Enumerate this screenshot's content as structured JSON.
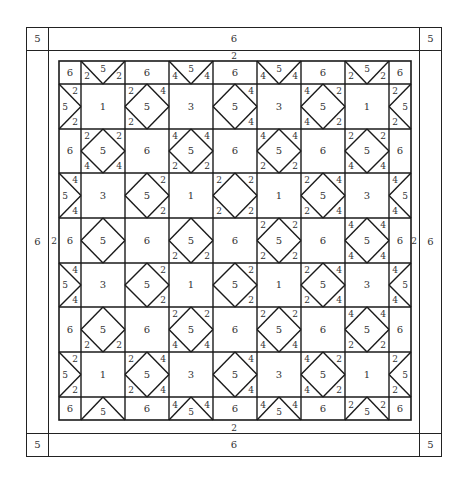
{
  "diagram": {
    "type": "quilt-layout",
    "outer_border": {
      "top_label": "6",
      "bottom_label": "6",
      "left_label": "6",
      "right_label": "6",
      "corner_label": "5"
    },
    "inner_border": {
      "top_label": "2",
      "bottom_label": "2",
      "left_label": "2",
      "right_label": "2"
    },
    "grid": {
      "col_widths": [
        22,
        44,
        44,
        44,
        44,
        44,
        44,
        44,
        22
      ],
      "row_heights": [
        23,
        45,
        44,
        45,
        45,
        44,
        45,
        45,
        23
      ],
      "rows": [
        [
          {
            "t": "plain",
            "label": "6"
          },
          {
            "t": "ftop",
            "label": "5",
            "a": "2",
            "b": "2"
          },
          {
            "t": "plain",
            "label": "6"
          },
          {
            "t": "ftop",
            "label": "5",
            "a": "4",
            "b": "4"
          },
          {
            "t": "plain",
            "label": "6"
          },
          {
            "t": "ftop",
            "label": "5",
            "a": "4",
            "b": "4"
          },
          {
            "t": "plain",
            "label": "6"
          },
          {
            "t": "ftop",
            "label": "5",
            "a": "2",
            "b": "2"
          },
          {
            "t": "plain",
            "label": "6"
          }
        ],
        [
          {
            "t": "fleft",
            "label": "5",
            "a": "2",
            "b": "2"
          },
          {
            "t": "plain",
            "label": "1"
          },
          {
            "t": "diamond",
            "label": "5",
            "tl": "2",
            "tr": "4",
            "bl": "2",
            "br": ""
          },
          {
            "t": "plain",
            "label": "3"
          },
          {
            "t": "diamond",
            "label": "5",
            "tl": "",
            "tr": "4",
            "bl": "",
            "br": "4"
          },
          {
            "t": "plain",
            "label": "3"
          },
          {
            "t": "diamond",
            "label": "5",
            "tl": "4",
            "tr": "2",
            "bl": "4",
            "br": "2"
          },
          {
            "t": "plain",
            "label": "1"
          },
          {
            "t": "fright",
            "label": "5",
            "a": "2",
            "b": "2"
          }
        ],
        [
          {
            "t": "plain",
            "label": "6"
          },
          {
            "t": "diamond",
            "label": "5",
            "tl": "2",
            "tr": "2",
            "bl": "4",
            "br": "4"
          },
          {
            "t": "plain",
            "label": "6"
          },
          {
            "t": "diamond",
            "label": "5",
            "tl": "4",
            "tr": "4",
            "bl": "2",
            "br": "2"
          },
          {
            "t": "plain",
            "label": "6"
          },
          {
            "t": "diamond",
            "label": "5",
            "tl": "4",
            "tr": "4",
            "bl": "2",
            "br": "2"
          },
          {
            "t": "plain",
            "label": "6"
          },
          {
            "t": "diamond",
            "label": "5",
            "tl": "2",
            "tr": "2",
            "bl": "4",
            "br": "4"
          },
          {
            "t": "plain",
            "label": "6"
          }
        ],
        [
          {
            "t": "fleft",
            "label": "5",
            "a": "4",
            "b": "4"
          },
          {
            "t": "plain",
            "label": "3"
          },
          {
            "t": "diamond",
            "label": "5",
            "tl": "",
            "tr": "2",
            "bl": "",
            "br": "2"
          },
          {
            "t": "plain",
            "label": "1"
          },
          {
            "t": "diamond",
            "label": "",
            "tl": "2",
            "tr": "2",
            "bl": "2",
            "br": "2"
          },
          {
            "t": "plain",
            "label": "1"
          },
          {
            "t": "diamond",
            "label": "5",
            "tl": "2",
            "tr": "4",
            "bl": "2",
            "br": "4"
          },
          {
            "t": "plain",
            "label": "3"
          },
          {
            "t": "fright",
            "label": "5",
            "a": "4",
            "b": "4"
          }
        ],
        [
          {
            "t": "plain",
            "label": "6"
          },
          {
            "t": "diamond",
            "label": "5",
            "tl": "",
            "tr": "",
            "bl": "",
            "br": ""
          },
          {
            "t": "plain",
            "label": "6"
          },
          {
            "t": "diamond",
            "label": "5",
            "tl": "",
            "tr": "",
            "bl": "2",
            "br": "2"
          },
          {
            "t": "plain",
            "label": "6"
          },
          {
            "t": "diamond",
            "label": "5",
            "tl": "2",
            "tr": "2",
            "bl": "2",
            "br": "2"
          },
          {
            "t": "plain",
            "label": "6"
          },
          {
            "t": "diamond",
            "label": "5",
            "tl": "4",
            "tr": "4",
            "bl": "4",
            "br": "4"
          },
          {
            "t": "plain",
            "label": "6"
          }
        ],
        [
          {
            "t": "fleft",
            "label": "5",
            "a": "4",
            "b": "4"
          },
          {
            "t": "plain",
            "label": "3"
          },
          {
            "t": "diamond",
            "label": "5",
            "tl": "",
            "tr": "2",
            "bl": "",
            "br": "2"
          },
          {
            "t": "plain",
            "label": "1"
          },
          {
            "t": "diamond",
            "label": "5",
            "tl": "",
            "tr": "2",
            "bl": "",
            "br": "2"
          },
          {
            "t": "plain",
            "label": "1"
          },
          {
            "t": "diamond",
            "label": "5",
            "tl": "2",
            "tr": "4",
            "bl": "2",
            "br": "4"
          },
          {
            "t": "plain",
            "label": "3"
          },
          {
            "t": "fright",
            "label": "5",
            "a": "4",
            "b": "4"
          }
        ],
        [
          {
            "t": "plain",
            "label": "6"
          },
          {
            "t": "diamond",
            "label": "5",
            "tl": "",
            "tr": "",
            "bl": "2",
            "br": "2"
          },
          {
            "t": "plain",
            "label": "6"
          },
          {
            "t": "diamond",
            "label": "5",
            "tl": "2",
            "tr": "2",
            "bl": "4",
            "br": "4"
          },
          {
            "t": "plain",
            "label": "6"
          },
          {
            "t": "diamond",
            "label": "5",
            "tl": "2",
            "tr": "2",
            "bl": "4",
            "br": "4"
          },
          {
            "t": "plain",
            "label": "6"
          },
          {
            "t": "diamond",
            "label": "5",
            "tl": "4",
            "tr": "4",
            "bl": "2",
            "br": "2"
          },
          {
            "t": "plain",
            "label": "6"
          }
        ],
        [
          {
            "t": "fleft",
            "label": "5",
            "a": "2",
            "b": "2"
          },
          {
            "t": "plain",
            "label": "1"
          },
          {
            "t": "diamond",
            "label": "5",
            "tl": "2",
            "tr": "4",
            "bl": "2",
            "br": "4"
          },
          {
            "t": "plain",
            "label": "3"
          },
          {
            "t": "diamond",
            "label": "5",
            "tl": "",
            "tr": "4",
            "bl": "",
            "br": "4"
          },
          {
            "t": "plain",
            "label": "3"
          },
          {
            "t": "diamond",
            "label": "5",
            "tl": "4",
            "tr": "2",
            "bl": "4",
            "br": "2"
          },
          {
            "t": "plain",
            "label": "1"
          },
          {
            "t": "fright",
            "label": "5",
            "a": "2",
            "b": "2"
          }
        ],
        [
          {
            "t": "plain",
            "label": "6"
          },
          {
            "t": "fbot",
            "label": "5",
            "a": "",
            "b": ""
          },
          {
            "t": "plain",
            "label": "6"
          },
          {
            "t": "fbot",
            "label": "5",
            "a": "4",
            "b": "4"
          },
          {
            "t": "plain",
            "label": "6"
          },
          {
            "t": "fbot",
            "label": "5",
            "a": "4",
            "b": "4"
          },
          {
            "t": "plain",
            "label": "6"
          },
          {
            "t": "fbot",
            "label": "5",
            "a": "2",
            "b": "2"
          },
          {
            "t": "plain",
            "label": "6"
          }
        ]
      ]
    }
  }
}
